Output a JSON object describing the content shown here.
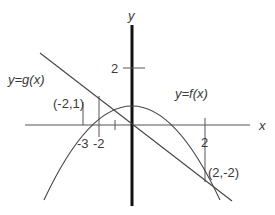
{
  "axes": {
    "x_label": "x",
    "y_label": "y"
  },
  "ticks": {
    "x_neg3": "-3",
    "x_neg2": "-2",
    "x_pos2": "2",
    "y_pos2": "2"
  },
  "curves": {
    "f_label": "y=f(x)",
    "g_label": "y=g(x)"
  },
  "points": {
    "p1": "(-2,1)",
    "p2": "(2,-2)"
  },
  "colors": {
    "stroke": "#3a3a3a",
    "background": "#ffffff"
  }
}
